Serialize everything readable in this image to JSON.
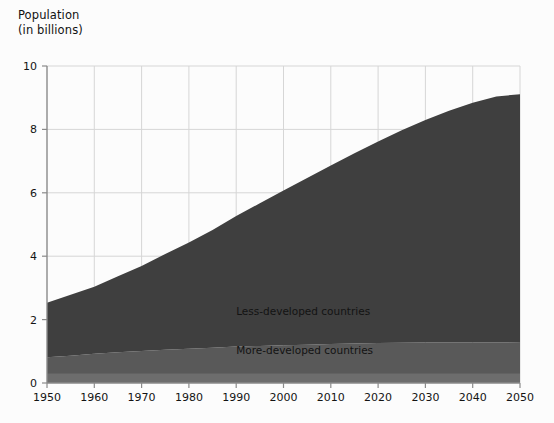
{
  "axis_title": {
    "line1": "Population",
    "line2": "(in billions)"
  },
  "colors": {
    "background": "#fcfcfc",
    "less_developed": "#3f3f3f",
    "more_developed": "#595959",
    "base_band": "#6d6d6d",
    "grid": "#d6d6d6",
    "axis": "#8a8a8a",
    "text": "#141414"
  },
  "chart_data": {
    "type": "area",
    "title": "Population (in billions)",
    "xlabel": "",
    "ylabel": "Population (in billions)",
    "xlim": [
      1950,
      2050
    ],
    "ylim": [
      0,
      10
    ],
    "grid": true,
    "stacked": true,
    "legend_position": "inline-annotation",
    "yticks": [
      0,
      2,
      4,
      6,
      8,
      10
    ],
    "xticks": [
      1950,
      1960,
      1970,
      1980,
      1990,
      2000,
      2010,
      2020,
      2030,
      2040,
      2050
    ],
    "x": [
      1950,
      1955,
      1960,
      1965,
      1970,
      1975,
      1980,
      1985,
      1990,
      1995,
      2000,
      2005,
      2010,
      2015,
      2020,
      2025,
      2030,
      2035,
      2040,
      2045,
      2050
    ],
    "series": [
      {
        "name": "More-developed countries",
        "values": [
          0.81,
          0.86,
          0.92,
          0.97,
          1.01,
          1.05,
          1.08,
          1.11,
          1.15,
          1.17,
          1.19,
          1.21,
          1.23,
          1.25,
          1.26,
          1.27,
          1.28,
          1.28,
          1.28,
          1.28,
          1.27
        ]
      },
      {
        "name": "Less-developed countries",
        "values": [
          1.72,
          1.92,
          2.12,
          2.4,
          2.68,
          3.02,
          3.35,
          3.72,
          4.12,
          4.5,
          4.88,
          5.26,
          5.63,
          6.0,
          6.36,
          6.7,
          7.02,
          7.31,
          7.56,
          7.76,
          7.84
        ]
      }
    ],
    "totals": [
      2.53,
      2.78,
      3.04,
      3.37,
      3.69,
      4.07,
      4.43,
      4.83,
      5.27,
      5.67,
      6.07,
      6.47,
      6.86,
      7.25,
      7.62,
      7.97,
      8.3,
      8.59,
      8.84,
      9.04,
      9.11
    ],
    "annotations": [
      {
        "text": "Less-developed countries",
        "x": 1990,
        "y": 2.15
      },
      {
        "text": "More-developed countries",
        "x": 1990,
        "y": 0.92
      }
    ]
  },
  "plot_geometry": {
    "left": 47,
    "right": 520,
    "top": 66,
    "bottom": 383
  }
}
